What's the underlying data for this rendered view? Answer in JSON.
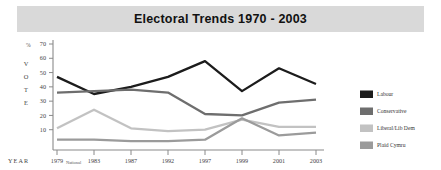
{
  "title": "Electoral Trends 1970 - 2003",
  "axis": {
    "y_unit": "%",
    "y_axis_label_chars": [
      "V",
      "O",
      "T",
      "E"
    ],
    "y_axis_label": "VOTE",
    "x_axis_label": "YEAR",
    "y_ticks": [
      70,
      60,
      50,
      40,
      30,
      20,
      10
    ],
    "x_tick_annotation": "National"
  },
  "legend": {
    "items": [
      {
        "label": "Labour",
        "color": "#1c1c1c"
      },
      {
        "label": "Conservative",
        "color": "#6e6e6e"
      },
      {
        "label": "Liberal/Lib Dem",
        "color": "#c2c2c2"
      },
      {
        "label": "Plaid Cymru",
        "color": "#9b9b9b"
      }
    ]
  },
  "chart_data": {
    "type": "line",
    "title": "Electoral Trends 1970 - 2003",
    "xlabel": "YEAR",
    "ylabel": "% VOTE",
    "ylim": [
      0,
      70
    ],
    "grid": false,
    "legend_position": "right",
    "categories": [
      "1979",
      "1983",
      "1987",
      "1992",
      "1997",
      "1999",
      "2001",
      "2003"
    ],
    "category_notes": [
      "National",
      "",
      "",
      "",
      "",
      "",
      "",
      ""
    ],
    "series": [
      {
        "name": "Labour",
        "color": "#1c1c1c",
        "values": [
          47,
          35,
          40,
          47,
          58,
          37,
          53,
          42
        ]
      },
      {
        "name": "Conservative",
        "color": "#6e6e6e",
        "values": [
          36,
          37,
          38,
          36,
          21,
          20,
          29,
          31
        ]
      },
      {
        "name": "Liberal/Lib Dem",
        "color": "#c2c2c2",
        "values": [
          11,
          24,
          11,
          9,
          10,
          17,
          12,
          12
        ]
      },
      {
        "name": "Plaid Cymru",
        "color": "#9b9b9b",
        "values": [
          3,
          3,
          2,
          2,
          3,
          18,
          6,
          8
        ]
      }
    ]
  }
}
